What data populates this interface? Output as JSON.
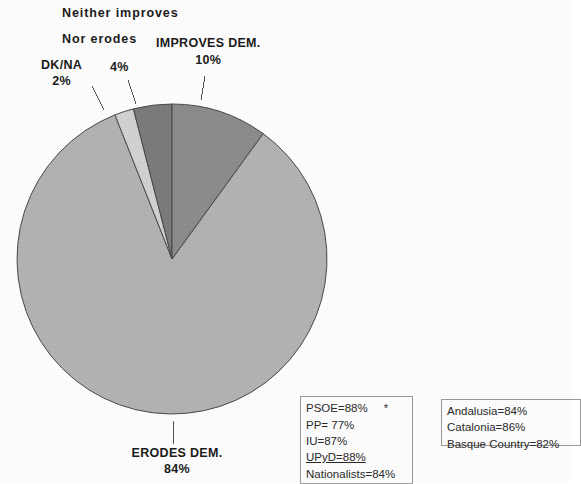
{
  "chart_data": {
    "type": "pie",
    "title": "",
    "subtitle": "",
    "legend_position": "bottom",
    "categories": [
      "IMPROVES DEM.",
      "ERODES DEM.",
      "DK/NA",
      "Neither improves Nor erodes"
    ],
    "values": [
      10,
      84,
      2,
      4
    ],
    "units": "%",
    "slices": [
      {
        "label": "IMPROVES DEM.",
        "value": 10,
        "value_text": "10%",
        "color": "#8d8d8d",
        "start_angle_deg": 0,
        "end_angle_deg": 36
      },
      {
        "label": "ERODES DEM.",
        "value": 84,
        "value_text": "84%",
        "color": "#b4b4b4",
        "start_angle_deg": 36,
        "end_angle_deg": 338.4
      },
      {
        "label": "DK/NA",
        "value": 2,
        "value_text": "2%",
        "color": "#d3d3d3",
        "start_angle_deg": 338.4,
        "end_angle_deg": 345.6
      },
      {
        "label": "Neither improves Nor erodes",
        "value": 4,
        "value_text": "4%",
        "color": "#7c7c7c",
        "start_angle_deg": 345.6,
        "end_angle_deg": 360
      }
    ],
    "annotations": [
      "PSOE=88%",
      "PP= 77%",
      "IU=87%",
      "UPyD=88%",
      "Nationalists=84%",
      "Andalusia=84%",
      "Catalonia=86%",
      "Basque Country=82%"
    ]
  },
  "labels": {
    "neither_line1": "Neither improves",
    "neither_line2": "Nor erodes",
    "nor_erodes_pct": "4%",
    "dkna_name": "DK/NA",
    "dkna_pct": "2%",
    "improves_name": "IMPROVES DEM.",
    "improves_pct": "10%",
    "erodes_name": "ERODES DEM.",
    "erodes_pct": "84%"
  },
  "legend_parties": {
    "rows": [
      {
        "text": "PSOE=88%",
        "underline": false,
        "star": "*"
      },
      {
        "text": "PP= 77%",
        "underline": false,
        "star": ""
      },
      {
        "text": "IU=87%",
        "underline": false,
        "star": ""
      },
      {
        "text": "UPyD=88%",
        "underline": true,
        "star": ""
      },
      {
        "text": "Nationalists=84%",
        "underline": false,
        "star": ""
      }
    ],
    "row0": "PSOE=88%",
    "row0_star": "*",
    "row1": "PP= 77%",
    "row2": "IU=87%",
    "row3": "UPyD=88%",
    "row4": "Nationalists=84%"
  },
  "legend_regions": {
    "row0": "Andalusia=84%",
    "row1": "Catalonia=86%",
    "row2": "Basque Country=82%"
  },
  "colors": {
    "background": "#ffffff",
    "slice_improves": "#8d8d8d",
    "slice_erodes": "#b4b4b4",
    "slice_dkna": "#d3d3d3",
    "slice_neither": "#7c7c7c",
    "outline": "#4a4a4a",
    "text": "#1c1c1c",
    "legend_border": "#9b9b9b"
  }
}
